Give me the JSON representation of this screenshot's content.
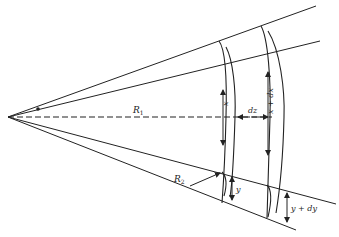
{
  "diagram": {
    "type": "geometric-figure",
    "colors": {
      "line": "#222222",
      "background": "#ffffff"
    },
    "labels": {
      "r1": "R",
      "r1_sub": "1",
      "r2": "R",
      "r2_sub": "2",
      "x": "x",
      "x_plus_dx": "x + dx",
      "dz": "dz",
      "y": "y",
      "y_plus_dy": "y + dy"
    }
  }
}
